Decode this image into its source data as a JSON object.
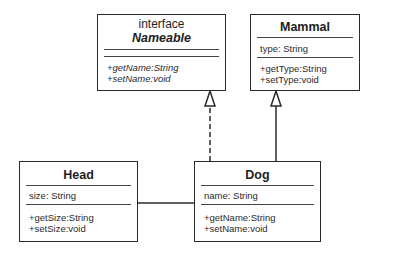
{
  "diagram": {
    "type": "UML class diagram",
    "classes": {
      "nameable": {
        "stereotype": "interface",
        "name": "Nameable",
        "attributes": [],
        "methods": [
          "+getName:String",
          "+setName:void"
        ]
      },
      "mammal": {
        "name": "Mammal",
        "attributes": [
          "type: String"
        ],
        "methods": [
          "+getType:String",
          "+setType:void"
        ]
      },
      "head": {
        "name": "Head",
        "attributes": [
          "size: String"
        ],
        "methods": [
          "+getSize:String",
          "+setSize:void"
        ]
      },
      "dog": {
        "name": "Dog",
        "attributes": [
          "name: String"
        ],
        "methods": [
          "+getName:String",
          "+setName:void"
        ]
      }
    },
    "relationships": [
      {
        "from": "Dog",
        "to": "Nameable",
        "kind": "realization",
        "style": "dashed",
        "arrowhead": "hollow-triangle"
      },
      {
        "from": "Dog",
        "to": "Mammal",
        "kind": "generalization",
        "style": "solid",
        "arrowhead": "hollow-triangle"
      },
      {
        "from": "Head",
        "to": "Dog",
        "kind": "association",
        "style": "solid",
        "arrowhead": "none"
      }
    ],
    "colors": {
      "line": "#2a2a2a",
      "background": "#ffffff",
      "text": "#1e1e1e"
    }
  }
}
